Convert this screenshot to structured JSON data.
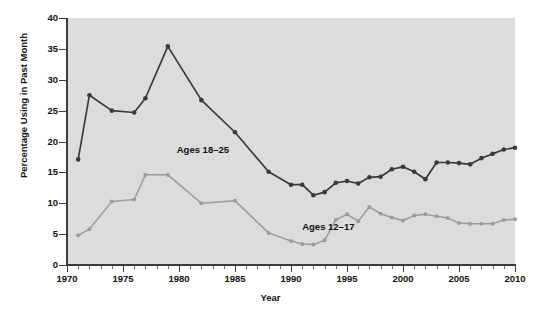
{
  "chart_data": {
    "type": "line",
    "title": "",
    "xlabel": "Year",
    "ylabel": "Percentage Using in Past Month",
    "xlim": [
      1970,
      2010
    ],
    "ylim": [
      0,
      40
    ],
    "ytick_labels": [
      "0",
      "5",
      "10",
      "15",
      "20",
      "25",
      "30",
      "35",
      "40"
    ],
    "ytick_values": [
      0,
      5,
      10,
      15,
      20,
      25,
      30,
      35,
      40
    ],
    "xtick_labels": [
      "1970",
      "1975",
      "1980",
      "1985",
      "1990",
      "1995",
      "2000",
      "2005",
      "2010"
    ],
    "xtick_values": [
      1970,
      1975,
      1980,
      1985,
      1990,
      1995,
      2000,
      2005,
      2010
    ],
    "minor_xticks": "every 1 year",
    "grid": false,
    "legend_position": "inline-annotations",
    "plot_background": "#dcdcdc",
    "series": [
      {
        "name": "Ages 18-25",
        "color": "#3a3a3a",
        "label": "Ages 18–25",
        "label_x": 1979.8,
        "label_y": 18.6,
        "x": [
          1971,
          1972,
          1974,
          1976,
          1977,
          1979,
          1982,
          1985,
          1988,
          1990,
          1991,
          1992,
          1993,
          1994,
          1995,
          1996,
          1997,
          1998,
          1999,
          2000,
          2001,
          2002,
          2003,
          2004,
          2005,
          2006,
          2007,
          2008,
          2009,
          2010
        ],
        "values": [
          17.1,
          27.5,
          25.0,
          24.7,
          27.0,
          35.4,
          26.7,
          21.5,
          15.1,
          13.0,
          13.0,
          11.3,
          11.8,
          13.3,
          13.6,
          13.2,
          14.2,
          14.3,
          15.5,
          15.9,
          15.1,
          13.9,
          16.6,
          16.6,
          16.5,
          16.3,
          17.3,
          18.0,
          18.7,
          19.0
        ]
      },
      {
        "name": "Ages 12-17",
        "color": "#9b9b9b",
        "label": "Ages 12–17",
        "label_x": 1991.0,
        "label_y": 6.1,
        "x": [
          1971,
          1972,
          1974,
          1976,
          1977,
          1979,
          1982,
          1985,
          1988,
          1990,
          1991,
          1992,
          1993,
          1994,
          1995,
          1996,
          1997,
          1998,
          1999,
          2000,
          2001,
          2002,
          2003,
          2004,
          2005,
          2006,
          2007,
          2008,
          2009,
          2010
        ],
        "values": [
          4.8,
          5.8,
          10.3,
          10.6,
          14.6,
          14.6,
          10.0,
          10.4,
          5.2,
          3.9,
          3.4,
          3.3,
          4.0,
          7.3,
          8.2,
          7.1,
          9.4,
          8.3,
          7.7,
          7.2,
          8.0,
          8.2,
          7.9,
          7.6,
          6.8,
          6.7,
          6.7,
          6.7,
          7.3,
          7.4
        ]
      }
    ]
  }
}
